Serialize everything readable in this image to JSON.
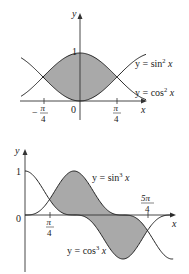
{
  "chart_data": [
    {
      "type": "area",
      "title": "",
      "xlabel": "x",
      "ylabel": "y",
      "series": [
        {
          "name": "y = sin² x",
          "function": "sin(x)^2"
        },
        {
          "name": "y = cos² x",
          "function": "cos(x)^2"
        }
      ],
      "shaded_region": {
        "between": [
          "cos² x",
          "sin² x"
        ],
        "x_from": "-π/4",
        "x_to": "π/4"
      },
      "x_ticks": [
        "-π/4",
        "0",
        "π/4"
      ],
      "y_ticks": [
        "1"
      ],
      "xlim": [
        -1.3,
        1.5
      ],
      "ylim": [
        0,
        1.1
      ],
      "intersections": [
        {
          "x": "-π/4",
          "y": 0.5
        },
        {
          "x": "π/4",
          "y": 0.5
        }
      ],
      "grid": false,
      "legend": "inline labels at right"
    },
    {
      "type": "area",
      "title": "",
      "xlabel": "x",
      "ylabel": "y",
      "series": [
        {
          "name": "y = sin³ x",
          "function": "sin(x)^3"
        },
        {
          "name": "y = cos³ x",
          "function": "cos(x)^3"
        }
      ],
      "shaded_region": {
        "between": [
          "sin³ x",
          "cos³ x"
        ],
        "x_from": "π/4",
        "x_to": "5π/4"
      },
      "x_ticks": [
        "0",
        "π/4",
        "5π/4"
      ],
      "y_ticks": [
        "1"
      ],
      "xlim": [
        0,
        4.8
      ],
      "ylim": [
        -1.1,
        1.1
      ],
      "intersections": [
        {
          "x": "π/4",
          "y": 0.354
        },
        {
          "x": "5π/4",
          "y": -0.354
        }
      ],
      "grid": false,
      "legend": "inline labels"
    }
  ],
  "top": {
    "y_axis_label": "y",
    "x_axis_label": "x",
    "tick_one": "1",
    "origin": "0",
    "tick_neg_pi4_num": "π",
    "tick_neg_pi4_sign": "−",
    "tick_neg_pi4_den": "4",
    "tick_pi4_num": "π",
    "tick_pi4_den": "4",
    "label_sin": "y = sin",
    "label_sin_exp": "2",
    "label_sin_var": "x",
    "label_cos": "y = cos",
    "label_cos_exp": "2",
    "label_cos_var": "x"
  },
  "bottom": {
    "y_axis_label": "y",
    "x_axis_label": "x",
    "tick_one": "1",
    "origin": "0",
    "tick_pi4_num": "π",
    "tick_pi4_den": "4",
    "tick_5pi4_num": "5π",
    "tick_5pi4_den": "4",
    "label_sin": "y = sin",
    "label_sin_exp": "3",
    "label_sin_var": "x",
    "label_cos": "y = cos",
    "label_cos_exp": "3",
    "label_cos_var": "x"
  },
  "colors": {
    "shade": "#a9a9a9",
    "line": "#222222",
    "axis": "#333333"
  }
}
